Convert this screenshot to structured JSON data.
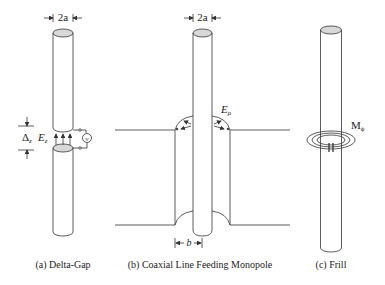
{
  "figure": {
    "panels": [
      {
        "id": "a",
        "caption": "(a)  Delta-Gap",
        "dimension_label": "2a",
        "gap_label": "Δ",
        "gap_sub": "z",
        "field_label": "E",
        "field_sub": "z",
        "source_label": "V"
      },
      {
        "id": "b",
        "caption": "(b)  Coaxial Line Feeding Monopole",
        "dimension_label": "2a",
        "field_label": "E",
        "field_sub": "ρ",
        "outer_label": "b"
      },
      {
        "id": "c",
        "caption": "(c)  Frill",
        "current_label": "M",
        "current_sub": "ϕ"
      }
    ],
    "colors": {
      "line": "#333333",
      "cap_fill": "#d8d8d8",
      "background": "#ffffff"
    }
  }
}
